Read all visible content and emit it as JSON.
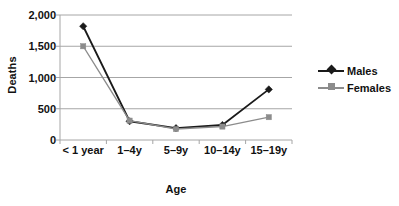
{
  "chart_data": {
    "type": "line",
    "title": "",
    "xlabel": "Age",
    "ylabel": "Deaths",
    "categories": [
      "< 1 year",
      "1–4y",
      "5–9y",
      "10–14y",
      "15–19y"
    ],
    "yticks": [
      "0",
      "500",
      "1,000",
      "1,500",
      "2,000"
    ],
    "ytick_values": [
      0,
      500,
      1000,
      1500,
      2000
    ],
    "ylim": [
      0,
      2000
    ],
    "grid": "horizontal",
    "legend_position": "right",
    "series": [
      {
        "name": "Males",
        "color": "#1a1a1a",
        "marker": "diamond",
        "values": [
          1820,
          300,
          190,
          240,
          810
        ]
      },
      {
        "name": "Females",
        "color": "#8c8c8c",
        "marker": "square",
        "values": [
          1500,
          310,
          175,
          215,
          365
        ]
      }
    ]
  }
}
